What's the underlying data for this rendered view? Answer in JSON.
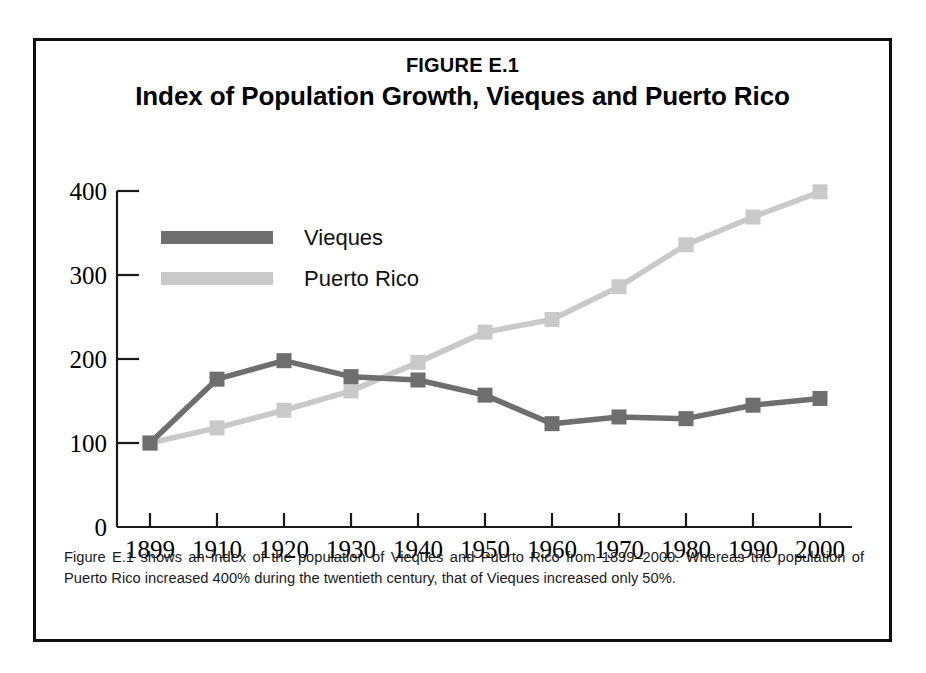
{
  "figure": {
    "number": "FIGURE E.1",
    "title": "Index of Population Growth, Vieques and Puerto Rico",
    "caption": "Figure E.1 shows an index of the population of Vieques and Puerto Rico from 1899–2000. Whereas the population of Puerto Rico increased 400% during the twentieth century, that of Vieques increased only 50%."
  },
  "colors": {
    "vieques": "#6e6e6e",
    "puerto_rico": "#c9c9c9",
    "axis": "#1a1a1a",
    "border": "#101010",
    "background": "#ffffff"
  },
  "chart_data": {
    "type": "line",
    "title": "Index of Population Growth, Vieques and Puerto Rico",
    "subtitle": "FIGURE E.1",
    "xlabel": "",
    "ylabel": "",
    "x": [
      1899,
      1910,
      1920,
      1930,
      1940,
      1950,
      1960,
      1970,
      1980,
      1990,
      2000
    ],
    "xticklabels": [
      "1899",
      "1910",
      "1920",
      "1930",
      "1940",
      "1950",
      "1960",
      "1970",
      "1980",
      "1990",
      "2000"
    ],
    "yticks": [
      0,
      100,
      200,
      300,
      400
    ],
    "yticklabels": [
      "0",
      "100",
      "200",
      "300",
      "400"
    ],
    "ylim": [
      0,
      430
    ],
    "grid": false,
    "legend_position": "upper-left",
    "markers": "square",
    "series": [
      {
        "name": "Vieques",
        "color": "#6e6e6e",
        "values": [
          100,
          176,
          198,
          179,
          175,
          157,
          123,
          131,
          129,
          145,
          153
        ]
      },
      {
        "name": "Puerto Rico",
        "color": "#c9c9c9",
        "values": [
          100,
          118,
          139,
          162,
          196,
          232,
          247,
          286,
          336,
          369,
          399
        ]
      }
    ]
  },
  "legend": {
    "items": [
      {
        "label": "Vieques",
        "color": "#6e6e6e"
      },
      {
        "label": "Puerto Rico",
        "color": "#c9c9c9"
      }
    ]
  }
}
